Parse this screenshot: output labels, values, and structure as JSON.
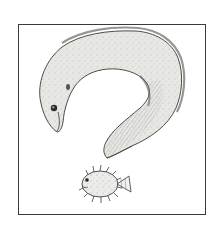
{
  "illustration": {
    "subject": "eel curled into question mark with pufferfish as dot",
    "style": "pencil sketch, grayscale",
    "colors": {
      "background": "#ffffff",
      "frame": "#3a3a3a",
      "body_fill": "#e6e6e3",
      "body_shade": "#9a9a96",
      "ink": "#3b3b3b"
    },
    "elements": [
      {
        "name": "eel",
        "icon": "eel-icon"
      },
      {
        "name": "pufferfish",
        "icon": "pufferfish-icon"
      }
    ]
  }
}
